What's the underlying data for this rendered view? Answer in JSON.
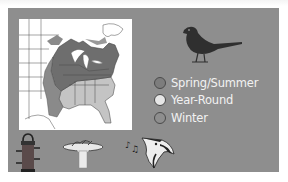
{
  "card": {
    "panel_color": "#8e8e8e",
    "map_background": "#ffffff"
  },
  "map": {
    "shading": {
      "spring_summer": "#6e6e6e",
      "year_round": "#c4c4c4",
      "winter": "#9a9a9a"
    }
  },
  "bird_silhouette": {
    "icon": "bird-silhouette-icon",
    "color": "#2f2f2f"
  },
  "legend": {
    "items": [
      {
        "label": "Spring/Summer",
        "swatch": "#7d7d7d"
      },
      {
        "label": "Year-Round",
        "swatch": "#e6e6e6"
      },
      {
        "label": "Winter",
        "swatch": "#8e8e8e"
      }
    ]
  },
  "bottom_icons": [
    {
      "name": "feeder-icon"
    },
    {
      "name": "birdbath-icon"
    },
    {
      "name": "birdsong-icon"
    }
  ]
}
